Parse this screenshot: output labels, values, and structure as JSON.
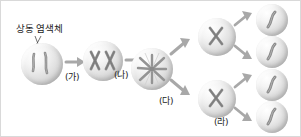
{
  "figure": {
    "title_label": "상동 염색체",
    "background_color": "#ffffff",
    "border_color": "#d9d9d9",
    "cell_fill_color": "#dcdcdc",
    "chromosome_color": "#8a8a8a",
    "arrow_color": "#a8a8a8",
    "text_color": "#1c1c1c"
  },
  "annotations": [
    {
      "id": "homologous",
      "label": "상동 염색체",
      "points_to": "cell-1-chromosomes"
    }
  ],
  "stages": [
    {
      "id": "ga",
      "label": "(가)"
    },
    {
      "id": "na",
      "label": "(나)"
    },
    {
      "id": "da",
      "label": "(다)"
    },
    {
      "id": "ra",
      "label": "(라)"
    }
  ],
  "cells": [
    {
      "id": "cell-1",
      "name": "initial-cell",
      "chromosome_form": "thin-pair",
      "count": 2
    },
    {
      "id": "cell-2",
      "name": "replicated-cell",
      "chromosome_form": "x-shaped-pair",
      "count": 2
    },
    {
      "id": "cell-3",
      "name": "metaphase-cell",
      "chromosome_form": "spindle",
      "count": 2
    },
    {
      "id": "cell-4",
      "name": "daughter-cell-upper",
      "chromosome_form": "x-shaped",
      "count": 1
    },
    {
      "id": "cell-5",
      "name": "daughter-cell-lower",
      "chromosome_form": "x-shaped",
      "count": 1
    },
    {
      "id": "cell-6",
      "name": "gamete-cell-1",
      "chromosome_form": "single",
      "count": 1
    },
    {
      "id": "cell-7",
      "name": "gamete-cell-2",
      "chromosome_form": "single",
      "count": 1
    },
    {
      "id": "cell-8",
      "name": "gamete-cell-3",
      "chromosome_form": "single",
      "count": 1
    },
    {
      "id": "cell-9",
      "name": "gamete-cell-4",
      "chromosome_form": "single",
      "count": 1
    }
  ],
  "arrows": [
    {
      "id": "arrow-1",
      "from": "cell-1",
      "to": "cell-2",
      "stage": "(가)"
    },
    {
      "id": "arrow-2",
      "from": "cell-2",
      "to": "cell-3",
      "stage": "(나)"
    },
    {
      "id": "arrow-3",
      "from": "cell-3",
      "to": "cell-4",
      "stage": "(다)"
    },
    {
      "id": "arrow-4",
      "from": "cell-3",
      "to": "cell-5",
      "stage": "(다)"
    },
    {
      "id": "arrow-5",
      "from": "cell-4",
      "to": "cell-6",
      "stage": "(라)"
    },
    {
      "id": "arrow-6",
      "from": "cell-4",
      "to": "cell-7",
      "stage": "(라)"
    },
    {
      "id": "arrow-7",
      "from": "cell-5",
      "to": "cell-8",
      "stage": "(라)"
    },
    {
      "id": "arrow-8",
      "from": "cell-5",
      "to": "cell-9",
      "stage": "(라)"
    }
  ]
}
